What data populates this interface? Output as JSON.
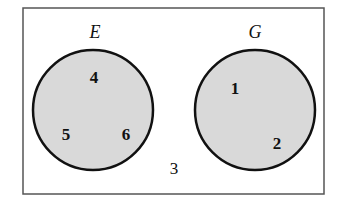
{
  "diagram": {
    "type": "venn",
    "universe": {
      "label": "",
      "outside_elements": [
        "3"
      ]
    },
    "sets": [
      {
        "name": "E",
        "elements": [
          "4",
          "5",
          "6"
        ]
      },
      {
        "name": "G",
        "elements": [
          "1",
          "2"
        ]
      }
    ]
  },
  "labels": {
    "set_e": "E",
    "set_g": "G",
    "e4": "4",
    "e5": "5",
    "e6": "6",
    "g1": "1",
    "g2": "2",
    "outside3": "3"
  },
  "colors": {
    "frame": "#555555",
    "circle_stroke": "#111111",
    "circle_fill": "#d9d9d9",
    "text": "#111111"
  }
}
